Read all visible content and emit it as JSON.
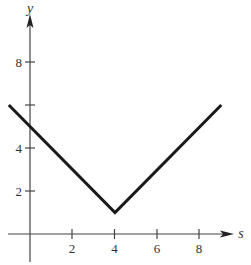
{
  "chart_data": {
    "type": "line",
    "title": "",
    "xlabel": "s",
    "ylabel": "y",
    "xlim": [
      -1.05,
      10
    ],
    "ylim": [
      -1.5,
      10.5
    ],
    "grid": false,
    "legend": null,
    "x_ticks": [
      2,
      4,
      6,
      8
    ],
    "x_tick_labels": [
      "2",
      "4",
      "6",
      "8"
    ],
    "y_ticks": [
      2,
      4,
      6,
      8
    ],
    "y_tick_labels": [
      "2",
      "4",
      "",
      "8"
    ],
    "series": [
      {
        "name": "y = |s - 4| + 1",
        "x": [
          -1,
          4,
          9
        ],
        "y": [
          6,
          1,
          6
        ],
        "color": "#1a1a1a"
      }
    ]
  },
  "labels": {
    "x_axis": "s",
    "y_axis": "y",
    "x_tick_2": "2",
    "x_tick_4": "4",
    "x_tick_6": "6",
    "x_tick_8": "8",
    "y_tick_2": "2",
    "y_tick_4": "4",
    "y_tick_8": "8"
  },
  "colors": {
    "axis": "#444444",
    "line": "#1a1a1a",
    "text": "#333333"
  }
}
